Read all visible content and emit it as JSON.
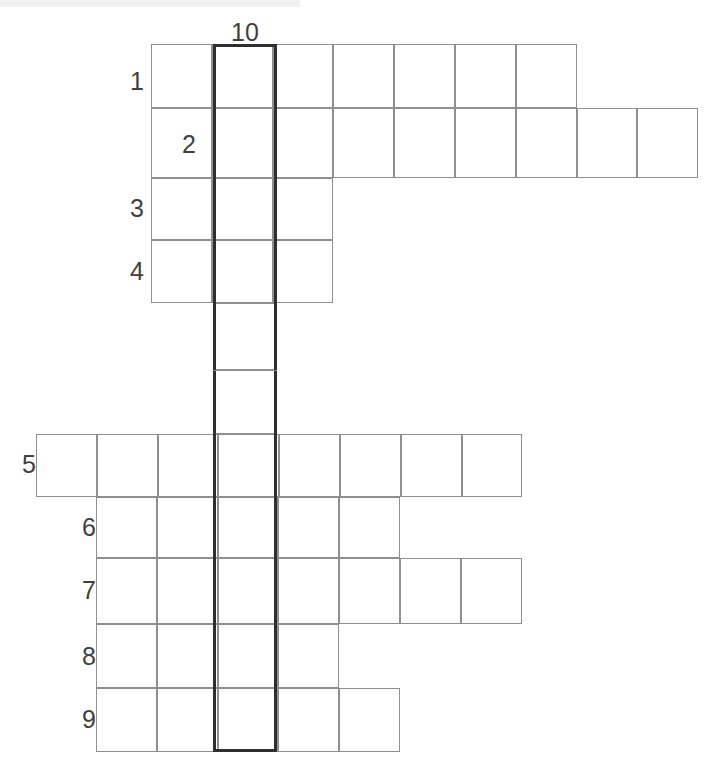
{
  "puzzle": {
    "type": "crossword-grid",
    "width": 719,
    "height": 763,
    "background_color": "#ffffff",
    "cell_border_color": "#8f8f8f",
    "highlight_border_color": "#2f2f2f",
    "number_color": "#3f3f3f",
    "cell_size": 60.8,
    "highlight_column_number": "10"
  },
  "column_labels": [
    {
      "label": "10",
      "x": 213,
      "y": 20,
      "width": 64
    }
  ],
  "row_labels": [
    {
      "label": "1",
      "x": 104,
      "y": 69,
      "width": 40
    },
    {
      "label": "2",
      "x": 156,
      "y": 132,
      "width": 40
    },
    {
      "label": "3",
      "x": 104,
      "y": 196,
      "width": 40
    },
    {
      "label": "4",
      "x": 104,
      "y": 259,
      "width": 40
    },
    {
      "label": "5",
      "x": -4,
      "y": 452,
      "width": 40
    },
    {
      "label": "6",
      "x": 56,
      "y": 515,
      "width": 40
    },
    {
      "label": "7",
      "x": 56,
      "y": 578,
      "width": 40
    },
    {
      "label": "8",
      "x": 56,
      "y": 644,
      "width": 40
    },
    {
      "label": "9",
      "x": 56,
      "y": 707,
      "width": 40
    }
  ],
  "rows": [
    {
      "number": "1",
      "start_x": 151,
      "y": 44,
      "height": 64,
      "cells": 7
    },
    {
      "number": "2",
      "start_x": 151,
      "y": 108,
      "height": 70,
      "cells": 9
    },
    {
      "number": "3",
      "start_x": 151,
      "y": 178,
      "height": 62,
      "cells": 3
    },
    {
      "number": "4",
      "start_x": 151,
      "y": 240,
      "height": 63,
      "cells": 3
    },
    {
      "number": "5",
      "start_x": 36,
      "y": 434,
      "height": 63,
      "cells": 8
    },
    {
      "number": "6",
      "start_x": 96,
      "y": 497,
      "height": 61,
      "cells": 5
    },
    {
      "number": "7",
      "start_x": 96,
      "y": 558,
      "height": 66,
      "cells": 7
    },
    {
      "number": "8",
      "start_x": 96,
      "y": 624,
      "height": 64,
      "cells": 4
    },
    {
      "number": "9",
      "start_x": 96,
      "y": 688,
      "height": 64,
      "cells": 5
    }
  ],
  "highlight_column": {
    "number": "10",
    "x": 213,
    "width": 64,
    "top": 44,
    "bottom": 752,
    "cell_boundaries": [
      44,
      108,
      178,
      240,
      303,
      370,
      434,
      497,
      558,
      624,
      688,
      752
    ],
    "standalone_separators": [
      370
    ]
  }
}
